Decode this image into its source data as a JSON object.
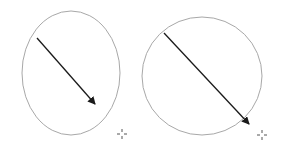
{
  "canvas": {
    "width": 283,
    "height": 151,
    "background": "#ffffff"
  },
  "colors": {
    "outline": "#a8a8a8",
    "arrow": "#1a1a1a",
    "crosshair": "#555555"
  },
  "figures": [
    {
      "name": "left-ellipse",
      "ellipse": {
        "cx": 71,
        "cy": 73,
        "rx": 49,
        "ry": 62
      },
      "arrow": {
        "x1": 37,
        "y1": 38,
        "x2": 95,
        "y2": 104
      },
      "crosshair": {
        "x": 122,
        "y": 134
      }
    },
    {
      "name": "right-circle",
      "ellipse": {
        "cx": 202,
        "cy": 76,
        "rx": 60,
        "ry": 59
      },
      "arrow": {
        "x1": 164,
        "y1": 33,
        "x2": 249,
        "y2": 124
      },
      "crosshair": {
        "x": 262,
        "y": 135
      }
    }
  ]
}
